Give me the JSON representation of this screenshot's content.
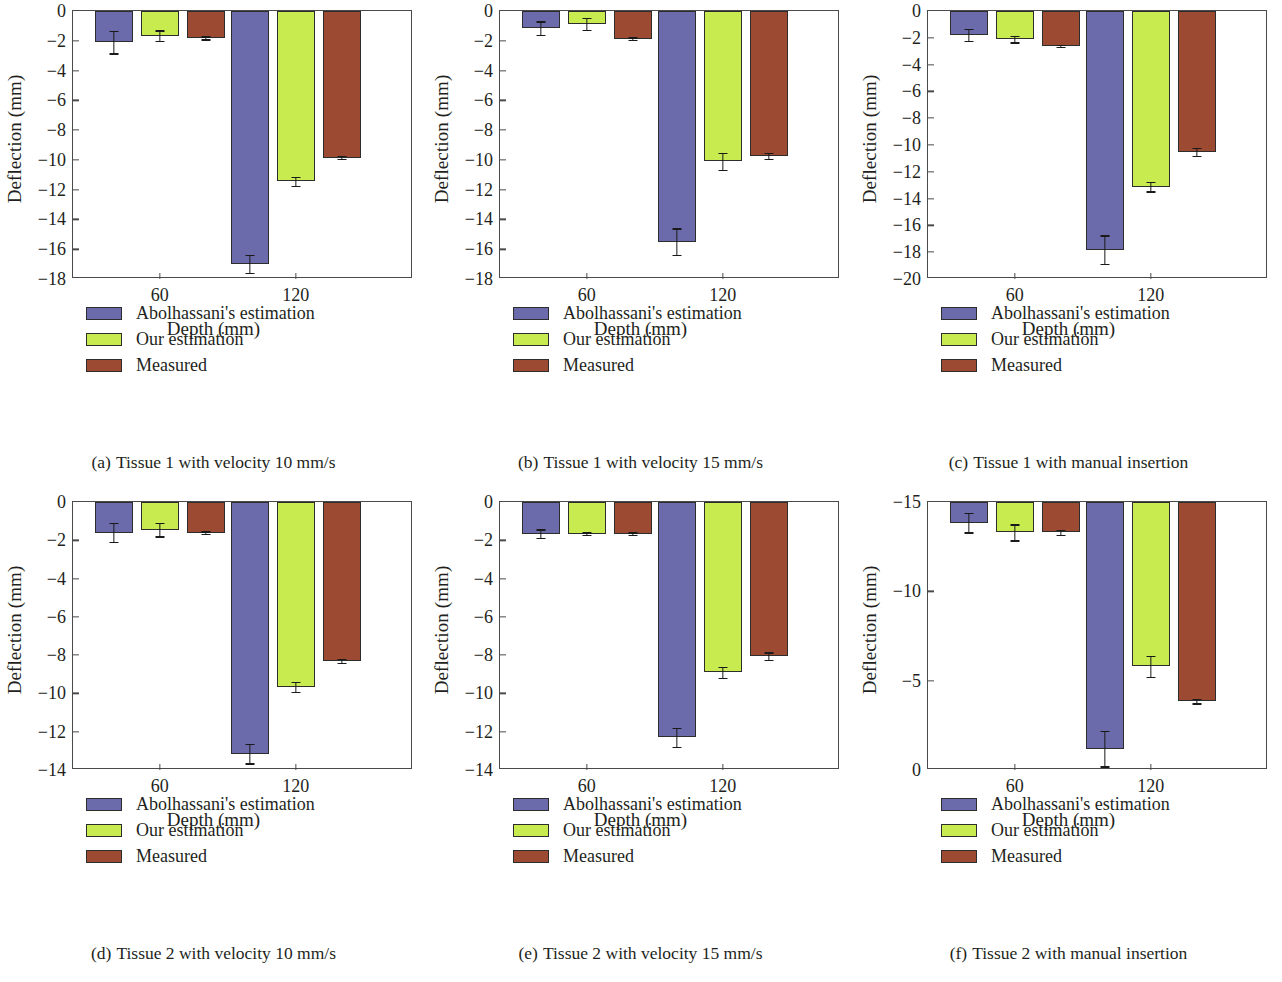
{
  "figure": {
    "series_names": [
      "Abolhassani's estimation",
      "Our estimation",
      "Measured"
    ],
    "series_colors": [
      "#6b6bab",
      "#c8ec50",
      "#9c4a32"
    ],
    "xlabel": "Depth (mm)",
    "ylabel": "Deflection (mm)",
    "categories": [
      "60",
      "120"
    ]
  },
  "chart_data": [
    {
      "id": "a",
      "type": "bar",
      "caption_index": "(a)",
      "caption": "Tissue 1 with velocity 10 mm/s",
      "title": "Tissue 1 with velocity 10 mm/s",
      "xlabel": "Depth (mm)",
      "ylabel": "Deflection (mm)",
      "categories": [
        "60",
        "120"
      ],
      "yticks": [
        0,
        -2,
        -4,
        -6,
        -8,
        -10,
        -12,
        -14,
        -16,
        -18
      ],
      "ytick_labels": [
        "0",
        "−2",
        "−4",
        "−6",
        "−8",
        "−10",
        "−12",
        "−14",
        "−16",
        "−18"
      ],
      "ylim": [
        -18,
        0
      ],
      "inverted": false,
      "grid": false,
      "legend_position": "below",
      "series": [
        {
          "name": "Abolhassani's estimation",
          "values": [
            -2.1,
            -17.0
          ],
          "errors": [
            0.75,
            0.6
          ]
        },
        {
          "name": "Our estimation",
          "values": [
            -1.65,
            -11.45
          ],
          "errors": [
            0.35,
            0.3
          ]
        },
        {
          "name": "Measured",
          "values": [
            -1.8,
            -9.85
          ],
          "errors": [
            0.1,
            0.1
          ]
        }
      ]
    },
    {
      "id": "b",
      "type": "bar",
      "caption_index": "(b)",
      "caption": "Tissue 1 with velocity 15 mm/s",
      "title": "Tissue 1 with velocity 15 mm/s",
      "xlabel": "Depth (mm)",
      "ylabel": "Deflection (mm)",
      "categories": [
        "60",
        "120"
      ],
      "yticks": [
        0,
        -2,
        -4,
        -6,
        -8,
        -10,
        -12,
        -14,
        -16,
        -18
      ],
      "ytick_labels": [
        "0",
        "−2",
        "−4",
        "−6",
        "−8",
        "−10",
        "−12",
        "−14",
        "−16",
        "−18"
      ],
      "ylim": [
        -18,
        0
      ],
      "inverted": false,
      "grid": false,
      "legend_position": "below",
      "series": [
        {
          "name": "Abolhassani's estimation",
          "values": [
            -1.15,
            -15.5
          ],
          "errors": [
            0.45,
            0.9
          ]
        },
        {
          "name": "Our estimation",
          "values": [
            -0.85,
            -10.1
          ],
          "errors": [
            0.4,
            0.55
          ]
        },
        {
          "name": "Measured",
          "values": [
            -1.85,
            -9.75
          ],
          "errors": [
            0.08,
            0.2
          ]
        }
      ]
    },
    {
      "id": "c",
      "type": "bar",
      "caption_index": "(c)",
      "caption": "Tissue 1 with manual insertion",
      "title": "Tissue 1 with manual insertion",
      "xlabel": "Depth (mm)",
      "ylabel": "Deflection (mm)",
      "categories": [
        "60",
        "120"
      ],
      "yticks": [
        0,
        -2,
        -4,
        -6,
        -8,
        -10,
        -12,
        -14,
        -16,
        -18,
        -20
      ],
      "ytick_labels": [
        "0",
        "−2",
        "−4",
        "−6",
        "−8",
        "−10",
        "−12",
        "−14",
        "−16",
        "−18",
        "−20"
      ],
      "ylim": [
        -20,
        0
      ],
      "inverted": false,
      "grid": false,
      "legend_position": "below",
      "series": [
        {
          "name": "Abolhassani's estimation",
          "values": [
            -1.8,
            -17.8
          ],
          "errors": [
            0.45,
            1.05
          ]
        },
        {
          "name": "Our estimation",
          "values": [
            -2.1,
            -13.1
          ],
          "errors": [
            0.25,
            0.35
          ]
        },
        {
          "name": "Measured",
          "values": [
            -2.6,
            -10.5
          ],
          "errors": [
            0.1,
            0.3
          ]
        }
      ]
    },
    {
      "id": "d",
      "type": "bar",
      "caption_index": "(d)",
      "caption": "Tissue 2 with velocity 10 mm/s",
      "title": "Tissue 2 with velocity 10 mm/s",
      "xlabel": "Depth (mm)",
      "ylabel": "Deflection (mm)",
      "categories": [
        "60",
        "120"
      ],
      "yticks": [
        0,
        -2,
        -4,
        -6,
        -8,
        -10,
        -12,
        -14
      ],
      "ytick_labels": [
        "0",
        "−2",
        "−4",
        "−6",
        "−8",
        "−10",
        "−12",
        "−14"
      ],
      "ylim": [
        -14,
        0
      ],
      "inverted": false,
      "grid": false,
      "legend_position": "below",
      "series": [
        {
          "name": "Abolhassani's estimation",
          "values": [
            -1.6,
            -13.15
          ],
          "errors": [
            0.5,
            0.5
          ]
        },
        {
          "name": "Our estimation",
          "values": [
            -1.45,
            -9.65
          ],
          "errors": [
            0.35,
            0.25
          ]
        },
        {
          "name": "Measured",
          "values": [
            -1.6,
            -8.3
          ],
          "errors": [
            0.07,
            0.12
          ]
        }
      ]
    },
    {
      "id": "e",
      "type": "bar",
      "caption_index": "(e)",
      "caption": "Tissue 2 with velocity 15 mm/s",
      "title": "Tissue 2 with velocity 15 mm/s",
      "xlabel": "Depth (mm)",
      "ylabel": "Deflection (mm)",
      "categories": [
        "60",
        "120"
      ],
      "yticks": [
        0,
        -2,
        -4,
        -6,
        -8,
        -10,
        -12,
        -14
      ],
      "ytick_labels": [
        "0",
        "−2",
        "−4",
        "−6",
        "−8",
        "−10",
        "−12",
        "−14"
      ],
      "ylim": [
        -14,
        0
      ],
      "inverted": false,
      "grid": false,
      "legend_position": "below",
      "series": [
        {
          "name": "Abolhassani's estimation",
          "values": [
            -1.65,
            -12.3
          ],
          "errors": [
            0.22,
            0.5
          ]
        },
        {
          "name": "Our estimation",
          "values": [
            -1.65,
            -8.9
          ],
          "errors": [
            0.07,
            0.3
          ]
        },
        {
          "name": "Measured",
          "values": [
            -1.65,
            -8.05
          ],
          "errors": [
            0.07,
            0.2
          ]
        }
      ]
    },
    {
      "id": "f",
      "type": "bar",
      "caption_index": "(f)",
      "caption": "Tissue 2 with manual insertion",
      "title": "Tissue 2 with manual insertion",
      "xlabel": "Depth (mm)",
      "ylabel": "Deflection (mm)",
      "categories": [
        "60",
        "120"
      ],
      "yticks": [
        -15,
        -10,
        -5,
        0
      ],
      "ytick_labels": [
        "−15",
        "−10",
        "−5",
        "0"
      ],
      "ylim": [
        -15,
        0
      ],
      "inverted": true,
      "grid": false,
      "legend_position": "below",
      "series": [
        {
          "name": "Abolhassani's estimation",
          "values": [
            -13.85,
            -1.2
          ],
          "errors": [
            0.55,
            1.0
          ]
        },
        {
          "name": "Our estimation",
          "values": [
            -13.3,
            -5.8
          ],
          "errors": [
            0.45,
            0.6
          ]
        },
        {
          "name": "Measured",
          "values": [
            -13.3,
            -3.85
          ],
          "errors": [
            0.15,
            0.12
          ]
        }
      ]
    }
  ]
}
